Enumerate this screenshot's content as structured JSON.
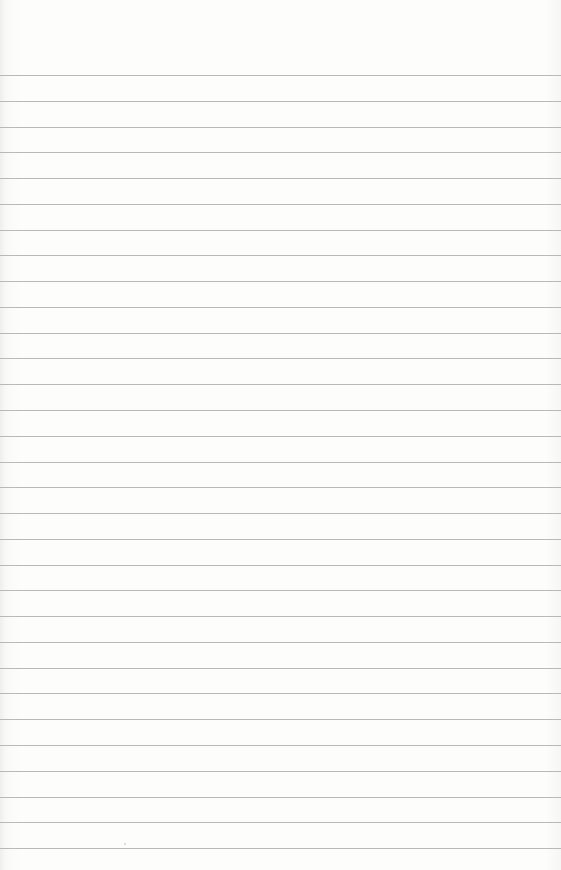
{
  "paper": {
    "type": "lined-paper",
    "line_color": "#b9b9b7",
    "background_color": "#fdfdfc",
    "first_line_y": 75,
    "line_spacing": 25.77,
    "line_count": 31,
    "text": ""
  }
}
